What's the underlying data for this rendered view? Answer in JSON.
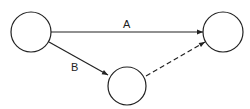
{
  "diagram": {
    "type": "activity-network",
    "nodes": [
      {
        "id": "left",
        "cx": 31,
        "cy": 32,
        "r": 20
      },
      {
        "id": "right",
        "cx": 223,
        "cy": 32,
        "r": 20
      },
      {
        "id": "bottom",
        "cx": 127,
        "cy": 86,
        "r": 19
      }
    ],
    "edges": [
      {
        "from": "left",
        "to": "right",
        "label": "A",
        "style": "solid"
      },
      {
        "from": "left",
        "to": "bottom",
        "label": "B",
        "style": "solid"
      },
      {
        "from": "bottom",
        "to": "right",
        "label": "",
        "style": "dashed"
      }
    ],
    "labels": {
      "a": "A",
      "b": "B"
    },
    "colors": {
      "stroke": "#222222",
      "background": "#ffffff"
    }
  }
}
